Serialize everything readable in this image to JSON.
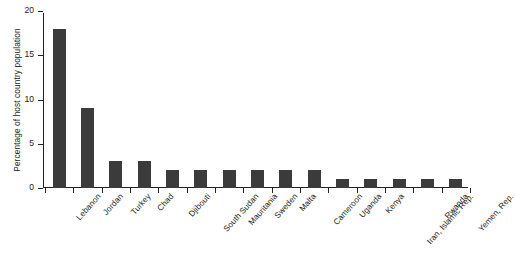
{
  "chart_data": {
    "type": "bar",
    "title": "",
    "xlabel": "",
    "ylabel": "Percentage of host country population",
    "ylim": [
      0,
      20
    ],
    "yticks": [
      0,
      5,
      10,
      15,
      20
    ],
    "ytick_labels": [
      "0",
      "5",
      "10",
      "15",
      "20"
    ],
    "grid": false,
    "legend": "none",
    "bar_color": "#3b3b3b",
    "categories": [
      "Lebanon",
      "Jordan",
      "Turkey",
      "Chad",
      "Djibouti",
      "South Sudan",
      "Mauritania",
      "Sweden",
      "Malta",
      "Cameroon",
      "Uganda",
      "Kenya",
      "Iran, Islamic Rep.",
      "Rwanda",
      "Yemen, Rep."
    ],
    "values": [
      18,
      9,
      3,
      3,
      2,
      2,
      2,
      2,
      2,
      2,
      1,
      1,
      1,
      1,
      1
    ]
  }
}
